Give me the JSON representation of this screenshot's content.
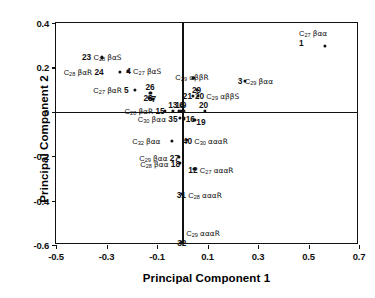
{
  "chart_data": {
    "type": "scatter",
    "title": "",
    "xlabel": "Principal Component 1",
    "ylabel": "Principal Component 2",
    "xlim": [
      -0.5,
      0.7
    ],
    "ylim": [
      -0.6,
      0.4
    ],
    "xticks": [
      "-0.5",
      "-0.3",
      "-0.1",
      "0.1",
      "0.3",
      "0.5",
      "0.7"
    ],
    "xtickvals": [
      -0.5,
      -0.3,
      -0.1,
      0.1,
      0.3,
      0.5,
      0.7
    ],
    "yticks": [
      "0.4",
      "0.2",
      "0",
      "-0.2",
      "-0.4",
      "-0.6"
    ],
    "ytickvals": [
      0.4,
      0.2,
      0,
      -0.2,
      -0.4,
      -0.6
    ],
    "grid": false,
    "legend": "none",
    "axis_origin_lines": true,
    "marker_color": "#111111",
    "points": [
      {
        "id": "1",
        "compound": "C",
        "carbon": "27",
        "stereo": "βαα",
        "x": 0.565,
        "y": 0.295,
        "label_pos": "above",
        "label": "C27 βαα 1"
      },
      {
        "id": "23",
        "compound": "C",
        "carbon": "28",
        "stereo": "βαS",
        "x": -0.318,
        "y": 0.245,
        "label_pos": "numfirst",
        "label": "23 C28 βαS"
      },
      {
        "id": "24",
        "compound": "C",
        "carbon": "28",
        "stereo": "βαR",
        "x": -0.248,
        "y": 0.178,
        "label_pos": "numafter",
        "label": "C28 βαR 24"
      },
      {
        "id": "4",
        "compound": "C",
        "carbon": "27",
        "stereo": "βαS",
        "x": -0.214,
        "y": 0.183,
        "label_pos": "numbefore",
        "label": "4 C27 βαS"
      },
      {
        "id": "5",
        "compound": "C",
        "carbon": "27",
        "stereo": "βαR",
        "x": -0.186,
        "y": 0.098,
        "label_pos": "numafter",
        "label": "C27 βαR 5"
      },
      {
        "id": "26",
        "compound": "",
        "carbon": "",
        "stereo": "",
        "x": -0.126,
        "y": 0.085,
        "label_pos": "alone",
        "label": "26"
      },
      {
        "id": "28",
        "compound": "",
        "carbon": "",
        "stereo": "",
        "x": -0.13,
        "y": 0.063,
        "label_pos": "alone",
        "label": "28"
      },
      {
        "id": "7",
        "compound": "",
        "carbon": "",
        "stereo": "",
        "x": -0.118,
        "y": 0.058,
        "label_pos": "alone",
        "label": "7"
      },
      {
        "id": "15",
        "compound": "C",
        "carbon": "28",
        "stereo": "βαR",
        "x": -0.07,
        "y": 0.003,
        "label_pos": "numafter",
        "label": "C28 βαR 15"
      },
      {
        "id": "13",
        "compound": "",
        "carbon": "",
        "stereo": "",
        "x": -0.036,
        "y": 0.004,
        "label_pos": "alone",
        "label": "13"
      },
      {
        "id": "14",
        "compound": "",
        "carbon": "",
        "stereo": "",
        "x": -0.012,
        "y": 0.004,
        "label_pos": "alone",
        "label": "14"
      },
      {
        "id": "6",
        "compound": "",
        "carbon": "",
        "stereo": "",
        "x": -0.004,
        "y": 0.004,
        "label_pos": "alone",
        "label": "6"
      },
      {
        "id": "9",
        "compound": "",
        "carbon": "",
        "stereo": "",
        "x": 0.006,
        "y": 0.004,
        "label_pos": "alone",
        "label": "9"
      },
      {
        "id": "20",
        "compound": "",
        "carbon": "",
        "stereo": "",
        "x": 0.09,
        "y": 0.003,
        "label_pos": "alone",
        "label": "20"
      },
      {
        "id": "35",
        "compound": "C",
        "carbon": "30",
        "stereo": "βαα",
        "x": -0.01,
        "y": -0.028,
        "label_pos": "numafter",
        "label": "C30 βαα 35"
      },
      {
        "id": "16",
        "compound": "",
        "carbon": "",
        "stereo": "",
        "x": 0.006,
        "y": -0.03,
        "label_pos": "alone",
        "label": "16"
      },
      {
        "id": "19",
        "compound": "",
        "carbon": "",
        "stereo": "",
        "x": 0.048,
        "y": -0.036,
        "label_pos": "alone",
        "label": "19"
      },
      {
        "id": "21",
        "compound": "",
        "carbon": "",
        "stereo": "",
        "x": 0.042,
        "y": 0.07,
        "label_pos": "alone",
        "label": "21"
      },
      {
        "id": "20b",
        "compound": "C",
        "carbon": "29",
        "stereo": "αββS",
        "x": 0.062,
        "y": 0.072,
        "label_pos": "numbefore",
        "label": "20 C29 αββS"
      },
      {
        "id": "29",
        "compound": "",
        "carbon": "",
        "stereo": "",
        "x": 0.058,
        "y": 0.098,
        "label_pos": "alone",
        "label": "29"
      },
      {
        "id": "30",
        "compound": "C",
        "carbon": "29",
        "stereo": "αββR",
        "x": 0.044,
        "y": 0.152,
        "label_pos": "cmponly",
        "label": "C29 αββR"
      },
      {
        "id": "3",
        "compound": "C",
        "carbon": "29",
        "stereo": "βαα",
        "x": 0.248,
        "y": 0.138,
        "label_pos": "numbefore",
        "label": "3 C29 βαα"
      },
      {
        "id": "40",
        "compound": "C",
        "carbon": "30",
        "stereo": "αααR",
        "x": 0.018,
        "y": -0.128,
        "label_pos": "numbefore",
        "label": "40 C30 αααR"
      },
      {
        "id": "37",
        "compound": "C",
        "carbon": "32",
        "stereo": "βαα",
        "x": -0.04,
        "y": -0.13,
        "label_pos": "cmponly",
        "label": "C32 βαα"
      },
      {
        "id": "27",
        "compound": "C",
        "carbon": "29",
        "stereo": "βαα",
        "x": -0.012,
        "y": -0.205,
        "label_pos": "numafter",
        "label": "C29 βαα 27"
      },
      {
        "id": "18",
        "compound": "C",
        "carbon": "28",
        "stereo": "βαα",
        "x": -0.008,
        "y": -0.232,
        "label_pos": "numafter",
        "label": "C28 βαα 18"
      },
      {
        "id": "12",
        "compound": "C",
        "carbon": "27",
        "stereo": "αααR",
        "x": 0.048,
        "y": -0.258,
        "label_pos": "numbefore",
        "label": "12 C27 αααR"
      },
      {
        "id": "31",
        "compound": "C",
        "carbon": "28",
        "stereo": "αααR",
        "x": -0.002,
        "y": -0.37,
        "label_pos": "numbefore",
        "label": "31 C28 αααR"
      },
      {
        "id": "32",
        "compound": "C",
        "carbon": "29",
        "stereo": "αααR",
        "x": 0.0,
        "y": -0.588,
        "label_pos": "numbelow",
        "label": "32 C29 αααR"
      }
    ]
  },
  "axes": {
    "x_title": "Principal Component 1",
    "y_title": "Principal Component 2",
    "x_ticks": [
      "-0.5",
      "-0.3",
      "-0.1",
      "0.1",
      "0.3",
      "0.5",
      "0.7"
    ],
    "y_ticks": [
      "0.4",
      "0.2",
      "0",
      "-0.2",
      "-0.4",
      "-0.6"
    ]
  },
  "labels": {
    "l1_num": "1",
    "l1_cmp_c": "C",
    "l1_cmp_sub": "27",
    "l1_cmp_st": "βαα",
    "l23_num": "23",
    "l23_cmp_c": "C",
    "l23_cmp_sub": "28",
    "l23_cmp_st": "βαS",
    "l24_num": "24",
    "l24_cmp_c": "C",
    "l24_cmp_sub": "28",
    "l24_cmp_st": "βαR",
    "l4_num": "4",
    "l4_cmp_c": "C",
    "l4_cmp_sub": "27",
    "l4_cmp_st": "βαS",
    "l5_num": "5",
    "l5_cmp_c": "C",
    "l5_cmp_sub": "27",
    "l5_cmp_st": "βαR",
    "l26_num": "26",
    "l28_num": "28",
    "l7_num": "7",
    "l15_num": "15",
    "l15_cmp_c": "C",
    "l15_cmp_sub": "28",
    "l15_cmp_st": "βαR",
    "l13_num": "13",
    "l14_num": "14",
    "l6_num": "6",
    "l9_num": "9",
    "l20_num": "20",
    "l35_num": "35",
    "l35_cmp_c": "C",
    "l35_cmp_sub": "30",
    "l35_cmp_st": "βαα",
    "l16_num": "16",
    "l19_num": "19",
    "l21_num": "21",
    "l20b_num": "20",
    "l20b_cmp_c": "C",
    "l20b_cmp_sub": "29",
    "l20b_cmp_st": "αββS",
    "l29_num": "29",
    "l30_cmp_c": "C",
    "l30_cmp_sub": "29",
    "l30_cmp_st": "αββR",
    "l3_num": "3",
    "l3_cmp_c": "C",
    "l3_cmp_sub": "29",
    "l3_cmp_st": "βαα",
    "l40_num": "40",
    "l40_cmp_c": "C",
    "l40_cmp_sub": "30",
    "l40_cmp_st": "αααR",
    "l37_cmp_c": "C",
    "l37_cmp_sub": "32",
    "l37_cmp_st": "βαα",
    "l27_num": "27",
    "l27_cmp_c": "C",
    "l27_cmp_sub": "29",
    "l27_cmp_st": "βαα",
    "l18_num": "18",
    "l18_cmp_c": "C",
    "l18_cmp_sub": "28",
    "l18_cmp_st": "βαα",
    "l12_num": "12",
    "l12_cmp_c": "C",
    "l12_cmp_sub": "27",
    "l12_cmp_st": "αααR",
    "l31_num": "31",
    "l31_cmp_c": "C",
    "l31_cmp_sub": "28",
    "l31_cmp_st": "αααR",
    "l32_num": "32",
    "l32_cmp_c": "C",
    "l32_cmp_sub": "29",
    "l32_cmp_st": "αααR"
  }
}
